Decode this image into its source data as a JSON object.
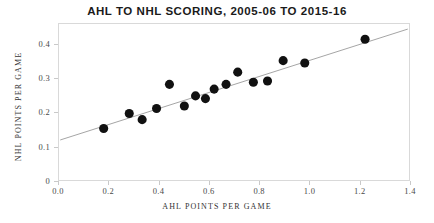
{
  "chart_data": {
    "type": "scatter",
    "title": "AHL TO NHL SCORING, 2005-06 TO 2015-16",
    "xlabel": "AHL POINTS PER GAME",
    "ylabel": "NHL POINTS PER GAME",
    "xlim": [
      0.0,
      1.4
    ],
    "ylim": [
      0.0,
      0.46
    ],
    "xticks": [
      "0.0",
      "0.2",
      "0.4",
      "0.6",
      "0.8",
      "1.0",
      "1.2",
      "1.4"
    ],
    "xtick_values": [
      0.0,
      0.2,
      0.4,
      0.6,
      0.8,
      1.0,
      1.2,
      1.4
    ],
    "yticks": [
      "0",
      "0.1",
      "0.2",
      "0.3",
      "0.4"
    ],
    "ytick_values": [
      0.0,
      0.1,
      0.2,
      0.3,
      0.4
    ],
    "grid": false,
    "legend": "none",
    "marker_color": "#111111",
    "trendline_color": "#9a9a9a",
    "frame_color": "#d9d9d9",
    "points": [
      {
        "x": 0.175,
        "y": 0.152
      },
      {
        "x": 0.278,
        "y": 0.196
      },
      {
        "x": 0.33,
        "y": 0.178
      },
      {
        "x": 0.388,
        "y": 0.211
      },
      {
        "x": 0.44,
        "y": 0.282
      },
      {
        "x": 0.5,
        "y": 0.218
      },
      {
        "x": 0.545,
        "y": 0.248
      },
      {
        "x": 0.585,
        "y": 0.24
      },
      {
        "x": 0.62,
        "y": 0.268
      },
      {
        "x": 0.668,
        "y": 0.282
      },
      {
        "x": 0.715,
        "y": 0.318
      },
      {
        "x": 0.778,
        "y": 0.288
      },
      {
        "x": 0.835,
        "y": 0.292
      },
      {
        "x": 0.898,
        "y": 0.352
      },
      {
        "x": 0.985,
        "y": 0.345
      },
      {
        "x": 1.228,
        "y": 0.415
      }
    ],
    "trendline": {
      "x0": 0.0,
      "y0": 0.118,
      "x1": 1.4,
      "y1": 0.445
    }
  }
}
